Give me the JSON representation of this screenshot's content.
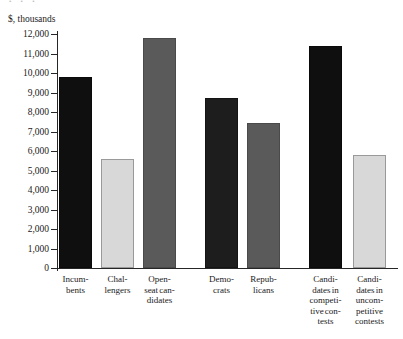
{
  "top_cropped_text": "· · ·",
  "axis_unit_label": "$, thousands",
  "chart_data": {
    "type": "bar",
    "title": "",
    "subtitle": "",
    "xlabel": "",
    "ylabel": "$, thousands",
    "ylim": [
      0,
      12000
    ],
    "ytick_step": 1000,
    "grid": false,
    "legend": "none",
    "ytick_labels": [
      "12,000",
      "11,000",
      "10,000",
      "9,000",
      "8,000",
      "7,000",
      "6,000",
      "5,000",
      "4,000",
      "3,000",
      "2,000",
      "1,000",
      "0"
    ],
    "ytick_values": [
      12000,
      11000,
      10000,
      9000,
      8000,
      7000,
      6000,
      5000,
      4000,
      3000,
      2000,
      1000,
      0
    ],
    "categories": [
      "Incumbents",
      "Challengers",
      "Open-seat candidates",
      "Democrats",
      "Republicans",
      "Candidates in competitive contests",
      "Candidates in uncompetitive contests"
    ],
    "category_label_lines": [
      [
        "Incum-",
        "bents"
      ],
      [
        "Chal-",
        "lengers"
      ],
      [
        "Open-",
        "seat can-",
        "didates"
      ],
      [
        "Demo-",
        "crats"
      ],
      [
        "Repub-",
        "licans"
      ],
      [
        "Candi-",
        "dates in",
        "competi-",
        "tive con-",
        "tests"
      ],
      [
        "Candi-",
        "dates in",
        "uncom-",
        "petitive",
        "contests"
      ]
    ],
    "values": [
      9800,
      5600,
      11800,
      8700,
      7450,
      11400,
      5800
    ],
    "bar_fills": [
      "black",
      "light",
      "mid",
      "dark",
      "mid",
      "black",
      "light"
    ],
    "groups": [
      {
        "name": "Incumbency status",
        "category_indices": [
          0,
          1,
          2
        ]
      },
      {
        "name": "Party",
        "category_indices": [
          3,
          4
        ]
      },
      {
        "name": "Contest competitiveness",
        "category_indices": [
          5,
          6
        ]
      }
    ]
  },
  "colors": {
    "black": "#100f0f",
    "dark": "#1d1d1d",
    "mid": "#5a5a5a",
    "light": "#d8d8d8",
    "axis": "#262626",
    "background": "#ffffff"
  }
}
